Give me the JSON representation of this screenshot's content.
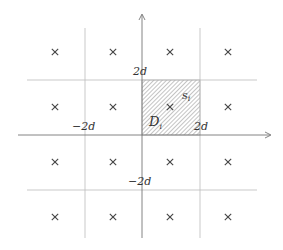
{
  "diagram": {
    "labels": {
      "y_top": "2d",
      "y_bottom": "−2d",
      "x_left": "−2d",
      "x_right": "2d",
      "region": "D",
      "region_sub": "i",
      "point": "s",
      "point_sub": "i"
    },
    "marker_glyph": "×",
    "grid": {
      "columns_x": [
        55,
        113,
        170,
        228
      ],
      "rows_y": [
        52,
        107,
        162,
        217
      ]
    },
    "colors": {
      "axis": "#777777",
      "gridline": "#bbbbbb",
      "hatch": "#888888",
      "marker": "#444444",
      "text": "#333333"
    }
  }
}
